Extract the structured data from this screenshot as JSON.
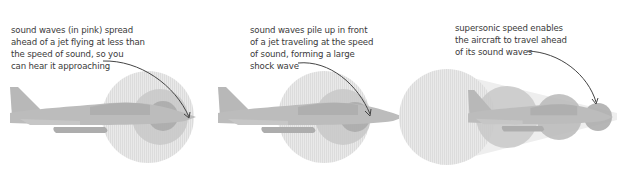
{
  "panels": [
    {
      "id": "subsonic",
      "caption_lines": [
        "sound waves (in pink) spread",
        "ahead of a jet flying at less than",
        "the speed of sound, so you",
        "can hear it approaching"
      ]
    },
    {
      "id": "sonic",
      "caption_lines": [
        "sound waves pile up in front",
        "of a jet traveling at the speed",
        "of sound, forming a large",
        "shock wave"
      ]
    },
    {
      "id": "supersonic",
      "caption_lines": [
        "supersonic speed enables",
        "the aircraft to travel ahead",
        "of its sound waves"
      ]
    }
  ],
  "colors": {
    "outer_wave": "#e4e4e4",
    "middle_wave": "#c9c9c9",
    "inner_wave": "#a9a9a9",
    "jet": "#bdbdbd",
    "arrow": "#444444",
    "text": "#3a3a3a"
  }
}
